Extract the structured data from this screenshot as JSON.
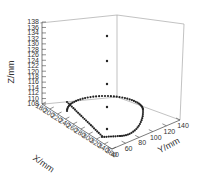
{
  "chart_data": {
    "type": "scatter3d",
    "title": "",
    "xlabel": "X/mm",
    "ylabel": "Y/mm",
    "zlabel": "Z/mm",
    "xlim": [
      180,
      360
    ],
    "ylim": [
      40,
      140
    ],
    "zlim": [
      108,
      138
    ],
    "x_ticks": [
      180,
      200,
      220,
      240,
      260,
      280,
      300,
      320,
      340,
      360
    ],
    "y_ticks": [
      40,
      60,
      80,
      100,
      120,
      140
    ],
    "z_ticks": [
      108,
      110,
      112,
      114,
      116,
      118,
      120,
      122,
      124,
      126,
      128,
      130,
      132,
      134,
      136,
      138
    ],
    "grid": false,
    "marker_color": "#222222",
    "series": [
      {
        "name": "contour",
        "description": "teardrop-shaped closed contour of points at Z≈110 mm",
        "z": 110
      },
      {
        "name": "vertical column",
        "description": "isolated points rising vertically above contour center",
        "points": [
          {
            "x": 280,
            "y": 90,
            "z": 112
          },
          {
            "x": 280,
            "y": 90,
            "z": 120
          },
          {
            "x": 280,
            "y": 90,
            "z": 128
          },
          {
            "x": 280,
            "y": 90,
            "z": 136
          }
        ]
      }
    ]
  }
}
